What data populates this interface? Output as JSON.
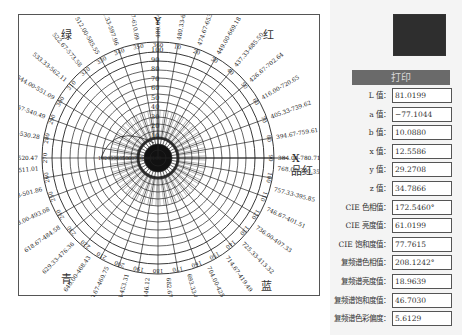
{
  "chart": {
    "center": [
      139,
      143
    ],
    "ring_radii": [
      8,
      14,
      20,
      27,
      34,
      41,
      48,
      56,
      64,
      72,
      80,
      88,
      97,
      106,
      116
    ],
    "spoke_count": 36,
    "axis_x_label": "X",
    "axis_y_label": "Y",
    "color_labels": {
      "green": "绿",
      "red": "红",
      "magenta": "品红",
      "blue": "蓝",
      "cyan": "青"
    },
    "center_scale_ticks": [
      "100",
      "90",
      "80",
      "70",
      "60",
      "50",
      "40",
      "30",
      "20",
      "10"
    ],
    "hue_angle_ticks": [
      "10",
      "20",
      "30",
      "40",
      "50",
      "60",
      "70",
      "80",
      "90",
      "100",
      "110",
      "120",
      "130",
      "140",
      "150",
      "160",
      "170",
      "180",
      "190",
      "200",
      "210",
      "220",
      "230",
      "240",
      "250",
      "260",
      "270",
      "280",
      "290",
      "300",
      "310",
      "320",
      "330",
      "340",
      "350",
      "360"
    ],
    "wavelength_labels": [
      {
        "angle": 90,
        "text": "480.00-624.57"
      },
      {
        "angle": 80,
        "text": "480.33-638.76"
      },
      {
        "angle": 70,
        "text": "474.67-653.62"
      },
      {
        "angle": 60,
        "text": "449.00-669.18"
      },
      {
        "angle": 50,
        "text": "437.33-685.50"
      },
      {
        "angle": 40,
        "text": "426.67-702.64"
      },
      {
        "angle": 30,
        "text": "416.00-720.65"
      },
      {
        "angle": 20,
        "text": "405.33-739.62"
      },
      {
        "angle": 10,
        "text": "394.67-759.61"
      },
      {
        "angle": 0,
        "text": "384.00-780.71"
      },
      {
        "angle": -5,
        "text": "768.00-390.35"
      },
      {
        "angle": -15,
        "text": "757.33-395.85"
      },
      {
        "angle": -25,
        "text": "746.67-401.51"
      },
      {
        "angle": -35,
        "text": "736.00-407.33"
      },
      {
        "angle": -45,
        "text": "725.33-413.32"
      },
      {
        "angle": -55,
        "text": "714.67-419.49"
      },
      {
        "angle": -65,
        "text": "704.00-425.84"
      },
      {
        "angle": -75,
        "text": "693.33-432.39"
      },
      {
        "angle": -85,
        "text": "682.67-439.15"
      },
      {
        "angle": -95,
        "text": "672.00-446.12"
      },
      {
        "angle": -105,
        "text": "661.33-453.31"
      },
      {
        "angle": -115,
        "text": "650.67-460.75"
      },
      {
        "angle": -125,
        "text": "640.00-468.43"
      },
      {
        "angle": -135,
        "text": "629.33-476.36"
      },
      {
        "angle": -145,
        "text": "618.67-484.58"
      },
      {
        "angle": -155,
        "text": "608.00-493.08"
      },
      {
        "angle": -165,
        "text": "597.33-501.86"
      },
      {
        "angle": -175,
        "text": "586.67-511.01"
      },
      {
        "angle": 180,
        "text": "576.00-520.47"
      },
      {
        "angle": 170,
        "text": "565.33-530.28"
      },
      {
        "angle": 160,
        "text": "554.67-540.49"
      },
      {
        "angle": 150,
        "text": "544.00-551.09"
      },
      {
        "angle": 140,
        "text": "533.33-562.11"
      },
      {
        "angle": 130,
        "text": "522.67-573.58"
      },
      {
        "angle": 120,
        "text": "512.00-585.55"
      },
      {
        "angle": 110,
        "text": "501.33-597.96"
      },
      {
        "angle": 100,
        "text": "490.67-610.89"
      }
    ]
  },
  "panel": {
    "swatch_color": "#2e2e2e",
    "print_button": "打印",
    "fields": [
      {
        "label": "L 值：",
        "value": "81.0199"
      },
      {
        "label": "a 值：",
        "value": "−77.1044"
      },
      {
        "label": "b 值：",
        "value": "10.0880"
      },
      {
        "label": "x 值：",
        "value": "12.5586"
      },
      {
        "label": "y 值：",
        "value": "29.2708"
      },
      {
        "label": "z 值：",
        "value": "34.7866"
      },
      {
        "label": "CIE 色相值：",
        "value": "172.5460°"
      },
      {
        "label": "CIE 亮度值：",
        "value": "61.0199"
      },
      {
        "label": "CIE 饱和度值：",
        "value": "77.7615"
      },
      {
        "label": "复频谱色相值：",
        "value": "208.1242°"
      },
      {
        "label": "复频谱亮度值：",
        "value": "18.9639"
      },
      {
        "label": "复频谱饱和度值：",
        "value": "46.7030"
      },
      {
        "label": "复频谱色彩偏度：",
        "value": "5.6129"
      }
    ]
  }
}
